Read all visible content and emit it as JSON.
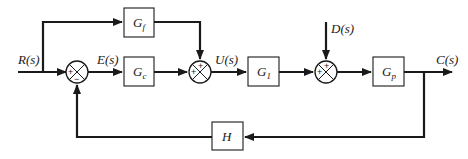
{
  "diagram": {
    "type": "block-diagram",
    "signals": {
      "input": "R(s)",
      "error": "E(s)",
      "control": "U(s)",
      "disturbance": "D(s)",
      "output": "C(s)"
    },
    "blocks": {
      "feedforward": {
        "base": "G",
        "sub": "f"
      },
      "controller": {
        "base": "G",
        "sub": "c"
      },
      "actuator": {
        "base": "G",
        "sub": "1"
      },
      "plant": {
        "base": "G",
        "sub": "p"
      },
      "feedback": {
        "base": "H",
        "sub": ""
      }
    },
    "junctions": {
      "sj1": {
        "left_sign": "+",
        "bottom_sign": "−"
      },
      "sj2": {
        "left_sign": "+",
        "top_sign": "+"
      },
      "sj3": {
        "left_sign": "+",
        "top_sign": "+"
      }
    },
    "colors": {
      "line": "#1a1a1a",
      "background": "#ffffff"
    }
  }
}
